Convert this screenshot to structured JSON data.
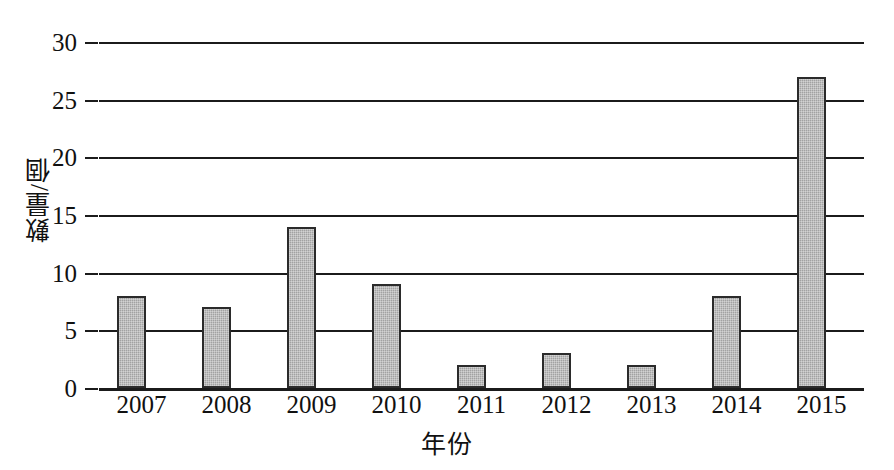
{
  "scan_artifacts": {
    "top_cropped_text": "、、、，，，，，，，，，，，，，，，，，，，",
    "bottom_cropped_text": "圖 一 、 二 〇 〇 七 年 至 二 〇 一 五 年 之 數 量 統 計 圖"
  },
  "chart_data": {
    "type": "bar",
    "title": "",
    "xlabel": "年份",
    "ylabel": "數量/個",
    "categories": [
      "2007",
      "2008",
      "2009",
      "2010",
      "2011",
      "2012",
      "2013",
      "2014",
      "2015"
    ],
    "values": [
      8,
      7,
      14,
      9,
      2,
      3,
      2,
      8,
      27
    ],
    "ylim": [
      0,
      30
    ],
    "ytick_labels": [
      "0",
      "5",
      "10",
      "15",
      "20",
      "25",
      "30"
    ],
    "ytick_values": [
      0,
      5,
      10,
      15,
      20,
      25,
      30
    ],
    "grid": "horizontal",
    "legend": "none",
    "bar_color": "#a2a2a2",
    "bar_edge_color": "#2b2b2b",
    "axis_color": "#1b1b1b"
  }
}
